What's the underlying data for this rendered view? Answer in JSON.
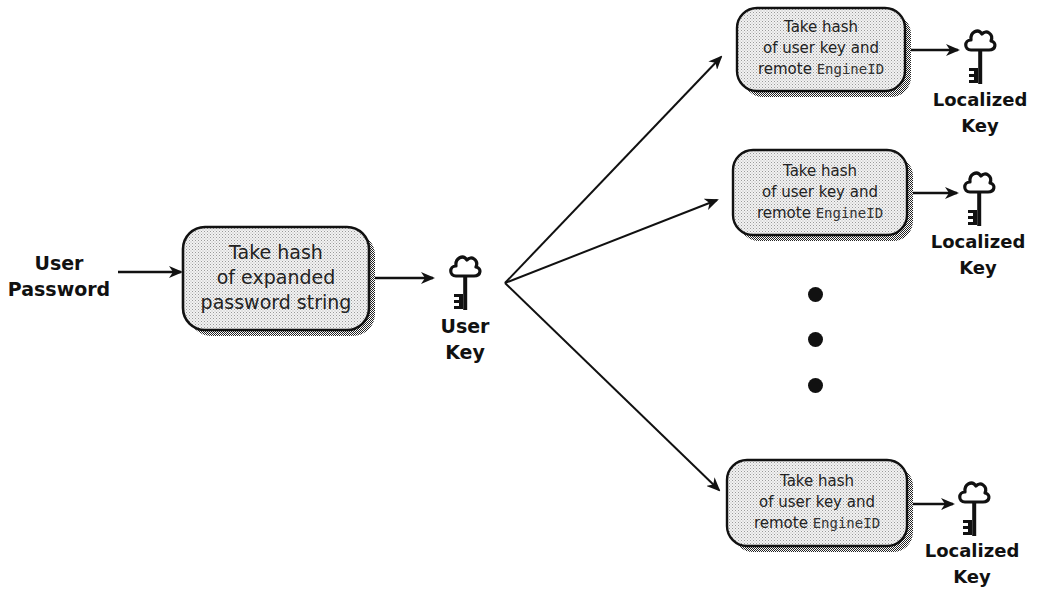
{
  "diagram": {
    "input_label": {
      "line1": "User",
      "line2": "Password"
    },
    "main_box": {
      "line1": "Take hash",
      "line2": "of expanded",
      "line3": "password string"
    },
    "user_key_label": {
      "line1": "User",
      "line2": "Key"
    },
    "localize_boxes": [
      {
        "line1": "Take hash",
        "line2": "of user key and",
        "line3_prefix": "remote ",
        "line3_code": "EngineID"
      },
      {
        "line1": "Take hash",
        "line2": "of user key and",
        "line3_prefix": "remote ",
        "line3_code": "EngineID"
      },
      {
        "line1": "Take hash",
        "line2": "of user key and",
        "line3_prefix": "remote ",
        "line3_code": "EngineID"
      }
    ],
    "localized_key_labels": [
      {
        "line1": "Localized",
        "line2": "Key"
      },
      {
        "line1": "Localized",
        "line2": "Key"
      },
      {
        "line1": "Localized",
        "line2": "Key"
      }
    ],
    "ellipsis": "vertical-dots",
    "icons": {
      "key": "key-icon",
      "arrow": "arrow-icon"
    },
    "colors": {
      "stroke": "#111111",
      "box_fill": "#e6e6e6",
      "shadow": "#555555",
      "background": "#ffffff"
    }
  }
}
